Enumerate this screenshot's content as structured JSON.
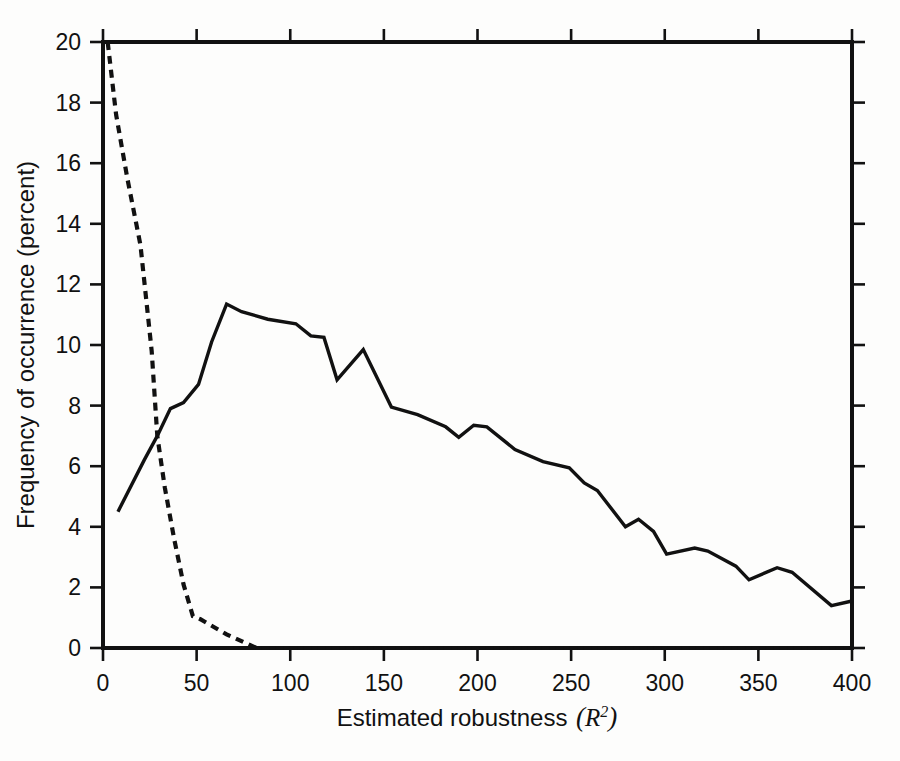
{
  "chart_data": {
    "type": "line",
    "title": "",
    "xlabel_text": "Estimated robustness",
    "xlabel_math": "R",
    "xlabel_math_sup": "2",
    "xlabel_paren_open": "(",
    "xlabel_paren_close": ")",
    "ylabel": "Frequency of occurrence (percent)",
    "xlim": [
      0,
      400
    ],
    "ylim": [
      0,
      20
    ],
    "xticks": [
      0,
      50,
      100,
      150,
      200,
      250,
      300,
      350,
      400
    ],
    "xtick_labels": [
      "0",
      "50",
      "100",
      "150",
      "200",
      "250",
      "300",
      "350",
      "400"
    ],
    "yticks": [
      0,
      2,
      4,
      6,
      8,
      10,
      12,
      14,
      16,
      18,
      20
    ],
    "ytick_labels": [
      "0",
      "2",
      "4",
      "6",
      "8",
      "10",
      "12",
      "14",
      "16",
      "18",
      "20"
    ],
    "grid": false,
    "legend": "none",
    "series": [
      {
        "name": "solid-curve",
        "style": "solid",
        "color": "#111111",
        "points": [
          [
            8,
            4.5
          ],
          [
            22,
            6.2
          ],
          [
            29,
            7.0
          ],
          [
            36,
            7.9
          ],
          [
            43,
            8.1
          ],
          [
            51,
            8.7
          ],
          [
            58,
            10.1
          ],
          [
            66,
            11.35
          ],
          [
            74,
            11.1
          ],
          [
            88,
            10.85
          ],
          [
            103,
            10.7
          ],
          [
            111,
            10.3
          ],
          [
            118,
            10.25
          ],
          [
            125,
            8.85
          ],
          [
            139,
            9.85
          ],
          [
            154,
            7.95
          ],
          [
            168,
            7.7
          ],
          [
            183,
            7.3
          ],
          [
            190,
            6.95
          ],
          [
            198,
            7.35
          ],
          [
            205,
            7.3
          ],
          [
            220,
            6.55
          ],
          [
            235,
            6.15
          ],
          [
            249,
            5.95
          ],
          [
            257,
            5.45
          ],
          [
            264,
            5.2
          ],
          [
            279,
            4.0
          ],
          [
            286,
            4.25
          ],
          [
            294,
            3.85
          ],
          [
            301,
            3.1
          ],
          [
            316,
            3.3
          ],
          [
            323,
            3.2
          ],
          [
            338,
            2.7
          ],
          [
            345,
            2.25
          ],
          [
            360,
            2.65
          ],
          [
            368,
            2.5
          ],
          [
            389,
            1.4
          ],
          [
            400,
            1.55
          ]
        ]
      },
      {
        "name": "dashed-curve",
        "style": "dashed",
        "color": "#111111",
        "points": [
          [
            2.5,
            20.0
          ],
          [
            7,
            17.6
          ],
          [
            13,
            15.5
          ],
          [
            20,
            13.3
          ],
          [
            26,
            9.8
          ],
          [
            29,
            7.0
          ],
          [
            33,
            5.3
          ],
          [
            38,
            3.6
          ],
          [
            43,
            2.1
          ],
          [
            48,
            1.05
          ],
          [
            52,
            0.95
          ],
          [
            66,
            0.45
          ],
          [
            82,
            0.0
          ],
          [
            400,
            0.0
          ]
        ]
      }
    ]
  },
  "figure": {
    "background": "#fdfdfc",
    "axis_color": "#111111"
  }
}
